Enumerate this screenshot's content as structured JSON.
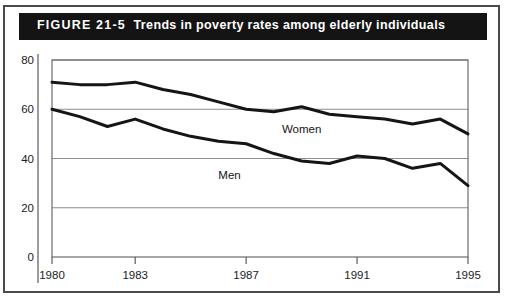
{
  "figure": {
    "number": "FIGURE 21-5",
    "title": "Trends in poverty rates among elderly individuals",
    "header_background": "#141414",
    "header_text_color": "#ffffff",
    "border_color": "#4a4a4a"
  },
  "chart_data": {
    "type": "line",
    "title": "Trends in poverty rates among elderly individuals",
    "xlabel": "",
    "ylabel": "",
    "xlim": [
      1980,
      1995
    ],
    "ylim": [
      0,
      80
    ],
    "ytick_labels": [
      "0",
      "20",
      "40",
      "60",
      "80"
    ],
    "yticks": [
      0,
      20,
      40,
      60,
      80
    ],
    "xtick_labels": [
      "1980",
      "1983",
      "1987",
      "1991",
      "1995"
    ],
    "xticks": [
      1980,
      1983,
      1987,
      1991,
      1995
    ],
    "grid": true,
    "legend": "inline-annotations",
    "line_color": "#151515",
    "x": [
      1980,
      1981,
      1982,
      1983,
      1984,
      1985,
      1986,
      1987,
      1988,
      1989,
      1990,
      1991,
      1992,
      1993,
      1994,
      1995
    ],
    "series": [
      {
        "name": "Women",
        "label": "Women",
        "label_x": 1989.0,
        "label_y": 50.5,
        "values": [
          71,
          70,
          70,
          71,
          68,
          66,
          63,
          60,
          59,
          61,
          58,
          57,
          56,
          54,
          56,
          50
        ]
      },
      {
        "name": "Men",
        "label": "Men",
        "label_x": 1986.4,
        "label_y": 31.5,
        "values": [
          60,
          57,
          53,
          56,
          52,
          49,
          47,
          46,
          42,
          39,
          38,
          41,
          40,
          36,
          38,
          29
        ]
      }
    ]
  }
}
